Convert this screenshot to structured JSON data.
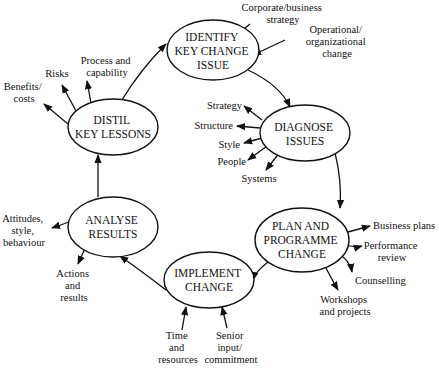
{
  "diagram": {
    "nodes": {
      "identify": {
        "lines": [
          "IDENTIFY",
          "KEY CHANGE",
          "ISSUE"
        ]
      },
      "diagnose": {
        "lines": [
          "DIAGNOSE",
          "ISSUES"
        ]
      },
      "plan": {
        "lines": [
          "PLAN AND",
          "PROGRAMME",
          "CHANGE"
        ]
      },
      "implement": {
        "lines": [
          "IMPLEMENT",
          "CHANGE"
        ]
      },
      "analyse": {
        "lines": [
          "ANALYSE",
          "RESULTS"
        ]
      },
      "distil": {
        "lines": [
          "DISTIL",
          "KEY LESSONS"
        ]
      }
    },
    "labels": {
      "corporate": [
        "Corporate/business",
        "strategy"
      ],
      "operational": [
        "Operational/",
        "organizational",
        "change"
      ],
      "strategy": [
        "Strategy"
      ],
      "structure": [
        "Structure"
      ],
      "style": [
        "Style"
      ],
      "people": [
        "People"
      ],
      "systems": [
        "Systems"
      ],
      "business_plans": [
        "Business plans"
      ],
      "performance": [
        "Performance",
        "review"
      ],
      "counselling": [
        "Counselling"
      ],
      "workshops": [
        "Workshops",
        "and projects"
      ],
      "time": [
        "Time",
        "and",
        "resources"
      ],
      "senior": [
        "Senior",
        "input/",
        "commitment"
      ],
      "attitudes": [
        "Attitudes,",
        "style,",
        "behaviour"
      ],
      "actions": [
        "Actions",
        "and",
        "results"
      ],
      "benefits": [
        "Benefits/",
        "costs"
      ],
      "risks": [
        "Risks"
      ],
      "process": [
        "Process and",
        "capability"
      ]
    }
  }
}
